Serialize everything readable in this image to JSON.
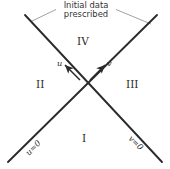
{
  "figure": {
    "background_color": "#ffffff",
    "line_color": "#2b2b2b",
    "text_color": "#2a2a2a",
    "width": 170,
    "height": 169
  },
  "caption": {
    "line1": "Initial data",
    "line2": "prescribed"
  },
  "quadrants": {
    "top": "IV",
    "left": "II",
    "right": "III",
    "bottom": "I"
  },
  "arrows": {
    "left": {
      "label": "u",
      "direction": "up-left"
    },
    "right": {
      "label": "v",
      "direction": "up-right"
    }
  },
  "characteristics": {
    "lower_left": "u=0",
    "lower_right": "v=0"
  },
  "geometry": {
    "center": {
      "x": 85,
      "y": 85
    },
    "line_a": {
      "x1": 25,
      "y1": 15,
      "x2": 162,
      "y2": 162
    },
    "line_b": {
      "x1": 157,
      "y1": 15,
      "x2": 8,
      "y2": 162
    },
    "leader_left": {
      "x1": 55,
      "y1": 9,
      "x2": 32,
      "y2": 22
    },
    "leader_right": {
      "x1": 117,
      "y1": 9,
      "x2": 150,
      "y2": 24
    }
  }
}
